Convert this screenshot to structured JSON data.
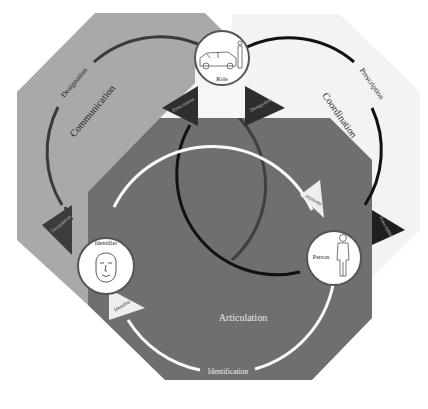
{
  "diagram": {
    "colors": {
      "background": "#ffffff",
      "communication_octagon": "#a9a9a9",
      "coordination_octagon": "#f3f3f3",
      "articulation_octagon": "#6f6f6f",
      "communication_ring": "#3a3a3a",
      "coordination_ring": "#111111",
      "articulation_ring": "#fafafa",
      "dark_arrow": "#2e2e2e",
      "light_arrow": "#eeeeee",
      "node_fill": "#ffffff",
      "node_stroke": "#555555"
    },
    "regions": {
      "communication": {
        "label": "Communication"
      },
      "coordination": {
        "label": "Coordination"
      },
      "articulation": {
        "label": "Articulation"
      }
    },
    "ring_labels": {
      "designation": "Designation",
      "prescription": "Prescription",
      "identification": "Identification"
    },
    "nodes": {
      "role": {
        "label": "Role",
        "icon": "car-and-person-icon"
      },
      "identifier": {
        "label": "Identifier",
        "icon": "face-icon"
      },
      "person": {
        "label": "Person",
        "icon": "standing-person-icon"
      }
    },
    "arrows": {
      "role_left": "Prescription",
      "role_right": "Designation",
      "communication_bottom": "Designation",
      "coordination_bottom": "Prescription",
      "articulation_right": "Identifier",
      "articulation_left": "Identifier"
    }
  }
}
